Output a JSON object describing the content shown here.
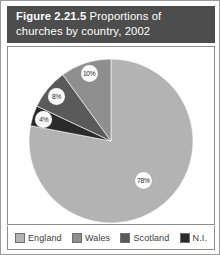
{
  "figure": {
    "number_label": "Figure 2.21.5",
    "title_rest": " Proportions of",
    "title_line2": "churches by country, 2002"
  },
  "chart_data": {
    "type": "pie",
    "title": "Figure 2.21.5 Proportions of churches by country, 2002",
    "categories": [
      "England",
      "Wales",
      "Scotland",
      "N.I."
    ],
    "values": [
      78,
      10,
      8,
      4
    ],
    "value_labels": [
      "78%",
      "10%",
      "8%",
      "4%"
    ],
    "unit": "%",
    "colors": [
      "#b3b3b3",
      "#8f8f8f",
      "#5a5a5a",
      "#2b2b2b"
    ],
    "start_angle_deg": 0,
    "direction": "clockwise",
    "legend_position": "bottom",
    "grid": false,
    "xlabel": "",
    "ylabel": ""
  },
  "legend": {
    "items": [
      {
        "label": "England",
        "color": "#b3b3b3"
      },
      {
        "label": "Wales",
        "color": "#8f8f8f"
      },
      {
        "label": "Scotland",
        "color": "#5a5a5a"
      },
      {
        "label": "N.I.",
        "color": "#2b2b2b"
      }
    ]
  }
}
